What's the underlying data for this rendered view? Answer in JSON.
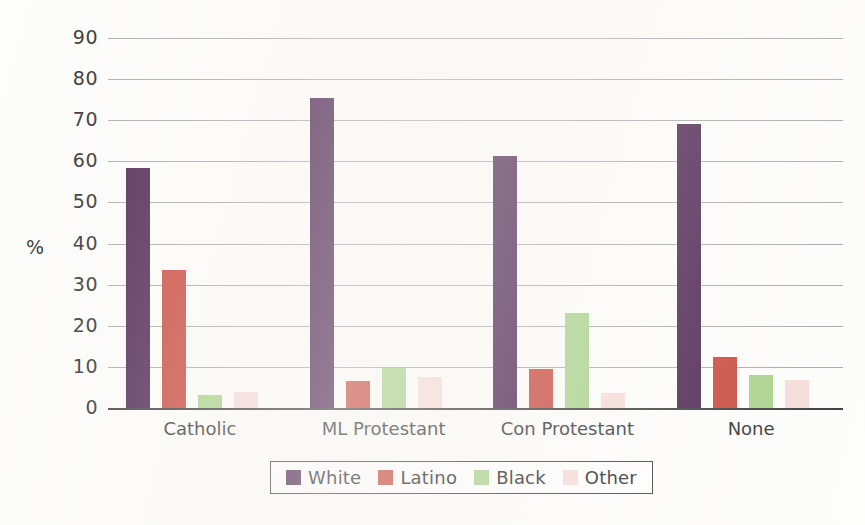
{
  "chart_data": {
    "type": "bar",
    "title": "",
    "subtitle": "",
    "xlabel": "",
    "ylabel": "%",
    "ylim": [
      0,
      90
    ],
    "yticks": [
      0,
      10,
      20,
      30,
      40,
      50,
      60,
      70,
      80,
      90
    ],
    "ytick_labels": [
      "0",
      "10",
      "20",
      "30",
      "40",
      "50",
      "60",
      "70",
      "80",
      "90"
    ],
    "grid": true,
    "legend_position": "bottom",
    "categories": [
      "Catholic",
      "ML Protestant",
      "Con Protestant",
      "None"
    ],
    "series": [
      {
        "name": "White",
        "color": "#4a2150",
        "values": [
          58.3,
          75.5,
          61.4,
          69.0
        ]
      },
      {
        "name": "Latino",
        "color": "#c8453a",
        "values": [
          33.5,
          6.5,
          9.4,
          12.3
        ]
      },
      {
        "name": "Black",
        "color": "#a8d28a",
        "values": [
          3.2,
          9.7,
          23.2,
          8.0
        ]
      },
      {
        "name": "Other",
        "color": "#f7dcd8",
        "values": [
          3.9,
          7.5,
          3.6,
          6.9
        ]
      }
    ]
  },
  "legend": {
    "entries": [
      {
        "label": "White",
        "color": "#4a2150"
      },
      {
        "label": "Latino",
        "color": "#c8453a"
      },
      {
        "label": "Black",
        "color": "#a8d28a"
      },
      {
        "label": "Other",
        "color": "#f7dcd8"
      }
    ]
  }
}
